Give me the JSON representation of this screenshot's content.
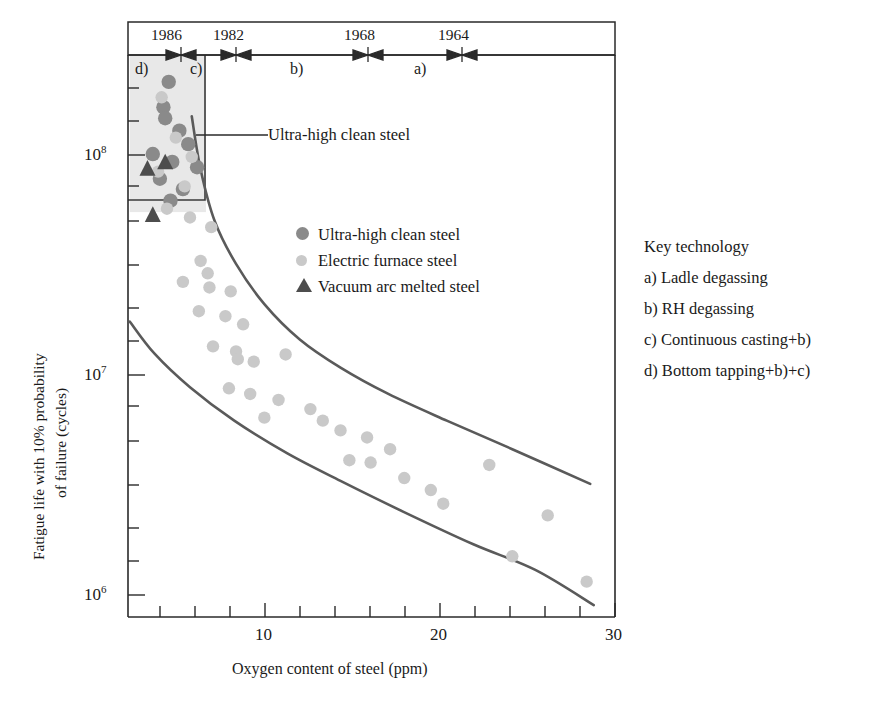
{
  "chart_data": {
    "type": "scatter",
    "title": "",
    "xlabel": "Oxygen content of steel (ppm)",
    "ylabel_line1": "Fatigue life with 10% probability",
    "ylabel_line2": "of failure (cycles)",
    "xlim": [
      2.5,
      30
    ],
    "ylim": [
      800000,
      300000000
    ],
    "yscale": "log",
    "xscale": "linear",
    "xticks_labeled": [
      10,
      20,
      30
    ],
    "xticks_minor": [
      4,
      6,
      8,
      12,
      14,
      16,
      18,
      22,
      24,
      26,
      28
    ],
    "yticks_labeled": [
      "10^8",
      "10^7",
      "10^6"
    ],
    "grid": false,
    "legend_position": "center",
    "series": [
      {
        "name": "Ultra-high clean steel",
        "marker": "circle",
        "color": "#8a8a8a",
        "points": [
          {
            "x": 4.8,
            "y": 215000000
          },
          {
            "x": 4.5,
            "y": 165000000
          },
          {
            "x": 4.6,
            "y": 147000000
          },
          {
            "x": 5.4,
            "y": 129000000
          },
          {
            "x": 3.9,
            "y": 101000000
          },
          {
            "x": 5.9,
            "y": 112000000
          },
          {
            "x": 5.0,
            "y": 93000000
          },
          {
            "x": 6.4,
            "y": 88000000
          },
          {
            "x": 4.3,
            "y": 78000000
          },
          {
            "x": 5.6,
            "y": 70000000
          },
          {
            "x": 4.9,
            "y": 62000000
          }
        ]
      },
      {
        "name": "Electric furnace steel",
        "marker": "circle",
        "color": "#c9c9c9",
        "points": [
          {
            "x": 4.4,
            "y": 183000000
          },
          {
            "x": 5.2,
            "y": 120000000
          },
          {
            "x": 6.1,
            "y": 98000000
          },
          {
            "x": 4.2,
            "y": 84000000
          },
          {
            "x": 5.7,
            "y": 72000000
          },
          {
            "x": 4.7,
            "y": 57000000
          },
          {
            "x": 6.0,
            "y": 52000000
          },
          {
            "x": 7.2,
            "y": 47000000
          },
          {
            "x": 6.6,
            "y": 33000000
          },
          {
            "x": 7.0,
            "y": 29000000
          },
          {
            "x": 5.6,
            "y": 26500000
          },
          {
            "x": 7.1,
            "y": 25000000
          },
          {
            "x": 8.3,
            "y": 24000000
          },
          {
            "x": 6.5,
            "y": 19500000
          },
          {
            "x": 8.0,
            "y": 18500000
          },
          {
            "x": 9.0,
            "y": 17000000
          },
          {
            "x": 7.3,
            "y": 13500000
          },
          {
            "x": 8.6,
            "y": 12800000
          },
          {
            "x": 8.7,
            "y": 11800000
          },
          {
            "x": 9.6,
            "y": 11500000
          },
          {
            "x": 11.4,
            "y": 12400000
          },
          {
            "x": 8.2,
            "y": 8700000
          },
          {
            "x": 9.4,
            "y": 8200000
          },
          {
            "x": 11.0,
            "y": 7700000
          },
          {
            "x": 10.2,
            "y": 6400000
          },
          {
            "x": 12.8,
            "y": 7000000
          },
          {
            "x": 13.5,
            "y": 6200000
          },
          {
            "x": 14.5,
            "y": 5600000
          },
          {
            "x": 16.0,
            "y": 5200000
          },
          {
            "x": 15.0,
            "y": 4100000
          },
          {
            "x": 16.2,
            "y": 4000000
          },
          {
            "x": 17.3,
            "y": 4600000
          },
          {
            "x": 18.1,
            "y": 3400000
          },
          {
            "x": 19.6,
            "y": 3000000
          },
          {
            "x": 20.3,
            "y": 2600000
          },
          {
            "x": 22.9,
            "y": 3900000
          },
          {
            "x": 24.2,
            "y": 1500000
          },
          {
            "x": 26.2,
            "y": 2300000
          },
          {
            "x": 28.4,
            "y": 1150000
          }
        ]
      },
      {
        "name": "Vacuum arc melted steel",
        "marker": "triangle",
        "color": "#4d4d4d",
        "points": [
          {
            "x": 3.6,
            "y": 86000000
          },
          {
            "x": 4.6,
            "y": 92000000
          },
          {
            "x": 3.9,
            "y": 53000000
          }
        ]
      }
    ],
    "bound_curves": [
      {
        "name": "upper-bound-curve",
        "color": "#5a5a5a",
        "points": [
          {
            "x": 6.1,
            "y": 150000000
          },
          {
            "x": 6.6,
            "y": 86000000
          },
          {
            "x": 7.4,
            "y": 50000000
          },
          {
            "x": 8.6,
            "y": 32000000
          },
          {
            "x": 10.2,
            "y": 21000000
          },
          {
            "x": 12.2,
            "y": 14500000
          },
          {
            "x": 14.5,
            "y": 10800000
          },
          {
            "x": 17.2,
            "y": 8200000
          },
          {
            "x": 20.5,
            "y": 6200000
          },
          {
            "x": 24.2,
            "y": 4600000
          },
          {
            "x": 28.6,
            "y": 3200000
          }
        ]
      },
      {
        "name": "lower-bound-curve",
        "color": "#5a5a5a",
        "points": [
          {
            "x": 2.6,
            "y": 17500000
          },
          {
            "x": 4.0,
            "y": 12500000
          },
          {
            "x": 6.0,
            "y": 8800000
          },
          {
            "x": 8.5,
            "y": 6200000
          },
          {
            "x": 11.5,
            "y": 4400000
          },
          {
            "x": 14.5,
            "y": 3300000
          },
          {
            "x": 18.0,
            "y": 2400000
          },
          {
            "x": 22.0,
            "y": 1700000
          },
          {
            "x": 25.5,
            "y": 1300000
          },
          {
            "x": 28.8,
            "y": 900000
          }
        ]
      }
    ],
    "shaded_region": {
      "name": "ultra-high-clean-steel-region",
      "x_range": [
        2.6,
        6.9
      ],
      "y_range": [
        55000000,
        300000000
      ],
      "fill": "#e8e8e8"
    },
    "annotation": {
      "text": "Ultra-high clean steel",
      "leader_from_x": 6.9,
      "leader_to_x": 10.6
    }
  },
  "timeline": {
    "title_note": "",
    "years": [
      {
        "label": "1986",
        "segment": "d)"
      },
      {
        "label": "1982",
        "segment": "c)"
      },
      {
        "label": "1968",
        "segment": "b)"
      },
      {
        "label": "1964",
        "segment": "a)"
      }
    ],
    "phases": [
      {
        "label": "d)"
      },
      {
        "label": "c)"
      },
      {
        "label": "b)"
      },
      {
        "label": "a)"
      }
    ]
  },
  "legend": {
    "items": [
      {
        "label": "Ultra-high clean steel",
        "marker": "circle-dark",
        "color": "#8a8a8a"
      },
      {
        "label": "Electric furnace steel",
        "marker": "circle-light",
        "color": "#c9c9c9"
      },
      {
        "label": "Vacuum arc melted steel",
        "marker": "triangle-dark",
        "color": "#4d4d4d"
      }
    ]
  },
  "key_technology": {
    "heading": "Key technology",
    "items": [
      "a) Ladle degassing",
      "b) RH degassing",
      "c) Continuous casting+b)",
      "d) Bottom tapping+b)+c)"
    ]
  },
  "axis_labels": {
    "x_title": "Oxygen content of steel (ppm)",
    "y_title_line1": "Fatigue life with 10% probability",
    "y_title_line2": "of failure (cycles)",
    "x_tick_10": "10",
    "x_tick_20": "20",
    "x_tick_30": "30",
    "y_tick_8_base": "10",
    "y_tick_8_exp": "8",
    "y_tick_7_base": "10",
    "y_tick_7_exp": "7",
    "y_tick_6_base": "10",
    "y_tick_6_exp": "6"
  },
  "annotation": {
    "ultra_high_label": "Ultra-high clean steel"
  }
}
